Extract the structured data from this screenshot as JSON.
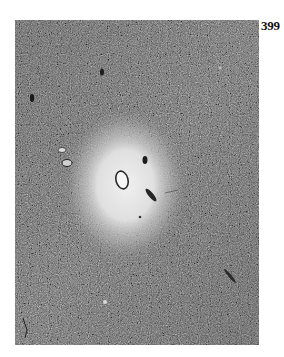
{
  "page": {
    "number": "399"
  },
  "figure": {
    "kind": "grayscale-micrograph",
    "colors": {
      "background_tissue": "#6e6e6e",
      "pale_center": "#ececec",
      "page_background": "#ffffff",
      "label_color": "#111111"
    }
  }
}
